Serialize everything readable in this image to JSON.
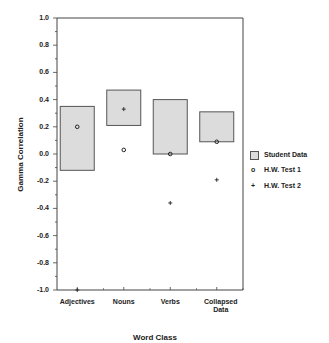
{
  "chart_data": {
    "type": "floating-bar-with-markers",
    "title": "",
    "xlabel": "Word Class",
    "ylabel": "Gamma Correlation",
    "ylim": [
      -1.0,
      1.0
    ],
    "yticks": [
      "1.0",
      "0.8",
      "0.6",
      "0.4",
      "0.2",
      "0.0",
      "-0.2",
      "-0.4",
      "-0.6",
      "-0.8",
      "-1.0"
    ],
    "categories": [
      "Adjectives",
      "Nouns",
      "Verbs",
      "Collapsed Data"
    ],
    "series": [
      {
        "name": "Student Data",
        "kind": "range-box",
        "low": [
          -0.12,
          0.21,
          0.0,
          0.09
        ],
        "high": [
          0.35,
          0.47,
          0.4,
          0.31
        ]
      },
      {
        "name": "H.W. Test 1",
        "kind": "marker-circle",
        "values": [
          0.2,
          0.03,
          0.0,
          0.09
        ]
      },
      {
        "name": "H.W. Test 2",
        "kind": "marker-plus",
        "values": [
          -1.0,
          0.33,
          -0.36,
          -0.19
        ]
      }
    ],
    "legend_position": "right",
    "grid": false
  },
  "axis": {
    "ylabel": "Gamma Correlation",
    "xlabel": "Word Class",
    "yticks": [
      "1.0",
      "0.8",
      "0.6",
      "0.4",
      "0.2",
      "0.0",
      "-0.2",
      "-0.4",
      "-0.6",
      "-0.8",
      "-1.0"
    ],
    "xticks": [
      "Adjectives",
      "Nouns",
      "Verbs",
      "Collapsed\nData"
    ]
  },
  "legend": {
    "items": [
      {
        "label": "Student Data",
        "symbol": "box"
      },
      {
        "label": "H.W. Test 1",
        "symbol": "o"
      },
      {
        "label": "H.W. Test 2",
        "symbol": "+"
      }
    ]
  },
  "colors": {
    "box_fill": "#dcdcdc",
    "box_stroke": "#555555",
    "axis": "#444444"
  }
}
